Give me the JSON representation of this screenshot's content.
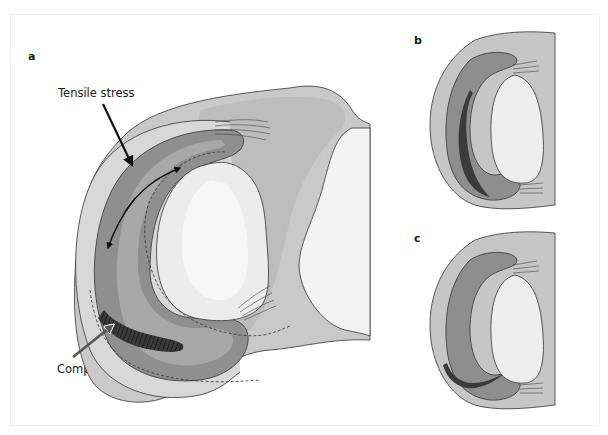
{
  "figure": {
    "panels": [
      {
        "id": "a",
        "label": "a"
      },
      {
        "id": "b",
        "label": "b"
      },
      {
        "id": "c",
        "label": "c"
      }
    ],
    "annotations": {
      "tensile": "Tensile stress",
      "compressive": "Compressive stress"
    },
    "colors": {
      "meniscus_dark": "#5a5a5a",
      "meniscus_mid": "#8c8c8c",
      "meniscus_light": "#b4b4b4",
      "tibia": "#c8c8c8",
      "condyle": "#ededed",
      "outline": "#2a2a2a",
      "compressive_arrow": "#555555",
      "tensile_arrow": "#111111"
    }
  }
}
